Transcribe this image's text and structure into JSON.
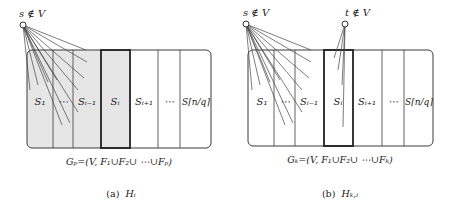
{
  "panels": [
    {
      "id": "a",
      "source_label": "s ∉ V",
      "set_labels": [
        "S₁",
        "⋯",
        "Sᵢ₋₁",
        "Sᵢ",
        "Sᵢ₊₁",
        "⋯",
        "S⌈n/q⌉"
      ],
      "graph_label": "Gₚ=(V, F₁∪F₂∪ ⋯∪Fₚ)",
      "caption_prefix": "(a)",
      "caption_symbol": "Hᵢ",
      "shaded_upto_index": 3,
      "highlighted_index": 3
    },
    {
      "id": "b",
      "source_label": "s ∉ V",
      "sink_label": "t ∉ V",
      "set_labels": [
        "S₁",
        "⋯",
        "Sᵢ₋₁",
        "Sᵢ",
        "Sᵢ₊₁",
        "⋯",
        "S⌈n/q⌉"
      ],
      "graph_label": "Gₖ=(V, F₁∪F₂∪ ⋯∪Fₖ)",
      "caption_prefix": "(b)",
      "caption_symbol": "Hₖ,ᵢ",
      "highlighted_index": 3
    }
  ],
  "colors": {
    "stroke": "#3a3a3a",
    "shade": "#e6e6e6",
    "text": "#222222"
  }
}
